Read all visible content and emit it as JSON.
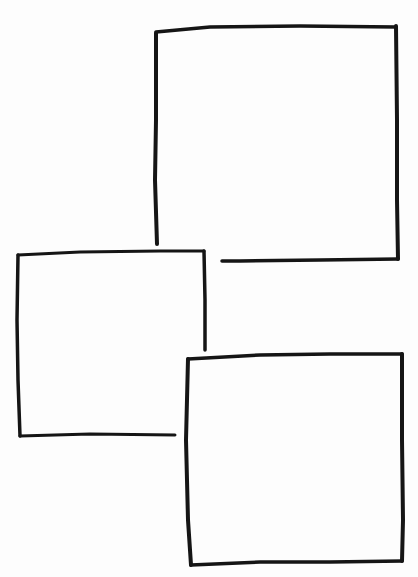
{
  "page": {
    "background": "#ffffff",
    "ink_color": "#151515",
    "cutoff_text": "~~ ~ ~~~ ~~~~ ~~~"
  },
  "frames": [
    {
      "name": "frame-top-right",
      "x": 156,
      "y": 28,
      "width": 242,
      "height": 234,
      "open_corner": "bottom-left"
    },
    {
      "name": "frame-middle-left",
      "x": 17,
      "y": 253,
      "width": 189,
      "height": 183,
      "open_corner": "bottom-right"
    },
    {
      "name": "frame-bottom-right",
      "x": 188,
      "y": 355,
      "width": 215,
      "height": 211,
      "open_corner": "none"
    }
  ]
}
